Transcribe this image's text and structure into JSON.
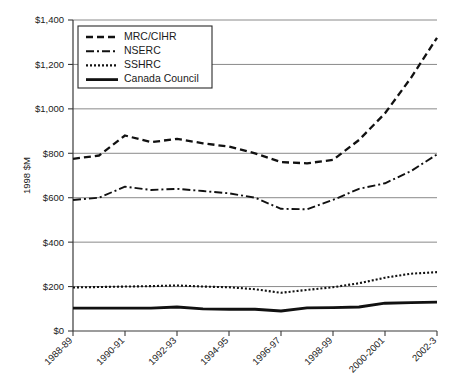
{
  "chart_data": {
    "type": "line",
    "title": "",
    "subtitle": "",
    "xlabel": "",
    "ylabel": "1998 $M",
    "ylim": [
      0,
      1400
    ],
    "ytick_step": 200,
    "ytick_labels": [
      "$0",
      "$200",
      "$400",
      "$600",
      "$800",
      "$1,000",
      "$1,200",
      "$1,400"
    ],
    "ytick_values": [
      0,
      200,
      400,
      600,
      800,
      1000,
      1200,
      1400
    ],
    "grid": true,
    "legend_position": "top-left",
    "x": [
      "1988-89",
      "1989-90",
      "1990-91",
      "1991-92",
      "1992-93",
      "1993-94",
      "1994-95",
      "1995-96",
      "1996-97",
      "1997-98",
      "1998-99",
      "1999-2000",
      "2000-2001",
      "2001-2002",
      "2002-3"
    ],
    "xtick_labels": [
      "1988-89",
      "1990-91",
      "1992-93",
      "1994-95",
      "1996-97",
      "1998-99",
      "2000-2001",
      "2002-3"
    ],
    "xtick_indices": [
      0,
      2,
      4,
      6,
      8,
      10,
      12,
      14
    ],
    "series": [
      {
        "name": "MRC/CIHR",
        "style": "dashed",
        "values": [
          775,
          790,
          880,
          850,
          865,
          845,
          830,
          800,
          760,
          755,
          770,
          860,
          980,
          1140,
          1320
        ]
      },
      {
        "name": "NSERC",
        "style": "dash-dot",
        "values": [
          590,
          600,
          650,
          635,
          640,
          630,
          620,
          600,
          550,
          548,
          590,
          640,
          665,
          720,
          795
        ]
      },
      {
        "name": "SSHRC",
        "style": "dotted",
        "values": [
          196,
          198,
          200,
          202,
          205,
          200,
          197,
          188,
          172,
          185,
          197,
          215,
          240,
          258,
          265
        ]
      },
      {
        "name": "Canada Council",
        "style": "solid",
        "values": [
          103,
          103,
          103,
          103,
          108,
          100,
          98,
          98,
          90,
          104,
          105,
          108,
          125,
          128,
          130
        ]
      }
    ]
  },
  "legend": {
    "entries": [
      {
        "label": "MRC/CIHR",
        "style": "dashed"
      },
      {
        "label": "NSERC",
        "style": "dash-dot"
      },
      {
        "label": "SSHRC",
        "style": "dotted"
      },
      {
        "label": "Canada Council",
        "style": "solid"
      }
    ]
  },
  "colors": {
    "line": "#111111",
    "grid": "#8a8a8a",
    "axis": "#3a3a3a",
    "background": "#ffffff"
  }
}
